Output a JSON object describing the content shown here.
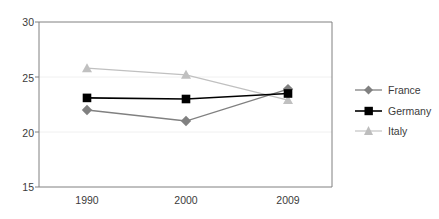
{
  "chart_data": {
    "type": "line",
    "title": "",
    "xlabel": "",
    "ylabel": "",
    "categories": [
      "1990",
      "2000",
      "2009"
    ],
    "ylim": [
      15,
      30
    ],
    "yticks": [
      15,
      20,
      25,
      30
    ],
    "ytick_labels": [
      "15",
      "20",
      "25",
      "30"
    ],
    "grid": true,
    "grid_axis": "y",
    "legend_position": "right",
    "series": [
      {
        "name": "France",
        "values": [
          22.0,
          21.0,
          23.9
        ],
        "color": "#808080",
        "marker": "diamond"
      },
      {
        "name": "Germany",
        "values": [
          23.1,
          23.0,
          23.5
        ],
        "color": "#000000",
        "marker": "square"
      },
      {
        "name": "Italy",
        "values": [
          25.8,
          25.2,
          22.9
        ],
        "color": "#c0c0c0",
        "marker": "triangle"
      }
    ]
  },
  "axes": {
    "y_tick_0": "15",
    "y_tick_1": "20",
    "y_tick_2": "25",
    "y_tick_3": "30",
    "x_tick_0": "1990",
    "x_tick_1": "2000",
    "x_tick_2": "2009"
  },
  "legend": {
    "items": [
      {
        "label": "France"
      },
      {
        "label": "Germany"
      },
      {
        "label": "Italy"
      }
    ]
  },
  "colors": {
    "france": "#808080",
    "germany": "#000000",
    "italy": "#c0c0c0",
    "axis": "#808080",
    "grid": "#f0f0f0",
    "text": "#3b3b3b",
    "background": "#ffffff"
  }
}
